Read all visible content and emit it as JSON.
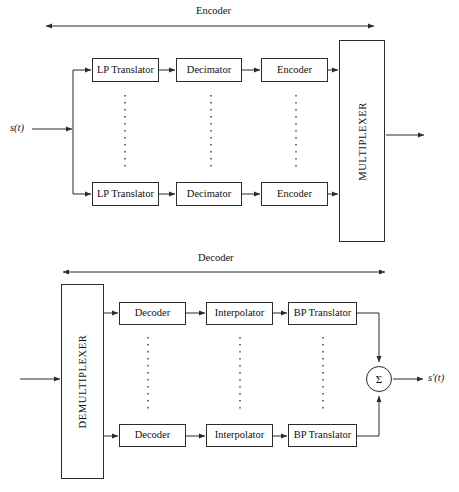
{
  "figure": {
    "type": "block-diagram",
    "title_encoder": "Encoder",
    "title_decoder": "Decoder",
    "input_signal_label": "s(t)",
    "output_signal_label": "s'(t)",
    "sum_symbol": "Σ",
    "line_color": "#2b2b2b",
    "background_color": "#ffffff",
    "ellipsis_glyph": "vertical-dotted-line"
  },
  "encoder_section": {
    "label": "Encoder",
    "multiplexer_label": "MULTIPLEXER",
    "input_label": "s(t)",
    "branches": [
      {
        "stages": [
          {
            "label": "LP Translator"
          },
          {
            "label": "Decimator"
          },
          {
            "label": "Encoder"
          }
        ]
      },
      {
        "stages": [
          {
            "label": "LP Translator"
          },
          {
            "label": "Decimator"
          },
          {
            "label": "Encoder"
          }
        ]
      }
    ]
  },
  "decoder_section": {
    "label": "Decoder",
    "demultiplexer_label": "DEMULTIPLEXER",
    "output_label": "s'(t)",
    "summation_label": "Σ",
    "branches": [
      {
        "stages": [
          {
            "label": "Decoder"
          },
          {
            "label": "Interpolator"
          },
          {
            "label": "BP Translator"
          }
        ]
      },
      {
        "stages": [
          {
            "label": "Decoder"
          },
          {
            "label": "Interpolator"
          },
          {
            "label": "BP Translator"
          }
        ]
      }
    ]
  }
}
